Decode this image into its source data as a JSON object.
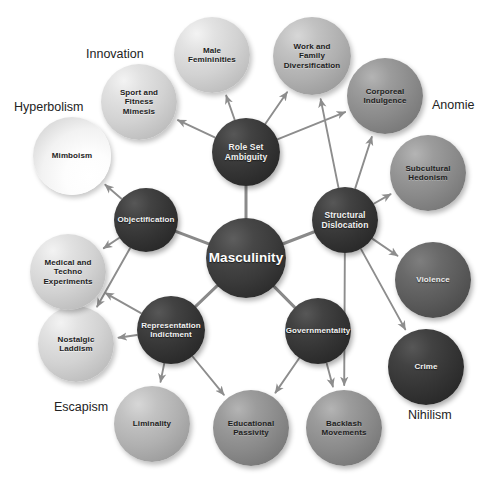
{
  "figure": {
    "kind": "concept-map",
    "background": "#ffffff",
    "hub_label": "Masculinity"
  },
  "captions": [
    {
      "id": "innovation",
      "label": "Innovation",
      "x": 86,
      "y": 47
    },
    {
      "id": "hyperbolism",
      "label": "Hyperbolism",
      "x": 14,
      "y": 100
    },
    {
      "id": "anomie",
      "label": "Anomie",
      "x": 432,
      "y": 98
    },
    {
      "id": "escapism",
      "label": "Escapism",
      "x": 54,
      "y": 400
    },
    {
      "id": "nihilism",
      "label": "Nihilism",
      "x": 408,
      "y": 408
    }
  ],
  "nodes": [
    {
      "id": "masculinity",
      "label": "Masculinity",
      "cx": 246,
      "cy": 258,
      "r": 40,
      "tone": "t-hub",
      "font": 13.5,
      "ring": "hub"
    },
    {
      "id": "role-set",
      "label": "Role Set<br>Ambiguity",
      "cx": 246,
      "cy": 152,
      "r": 34,
      "tone": "t-dark",
      "font": 8.5,
      "ring": "inner"
    },
    {
      "id": "structural",
      "label": "Structural<br>Dislocation",
      "cx": 345,
      "cy": 220,
      "r": 33,
      "tone": "t-dark",
      "font": 8.5,
      "ring": "inner"
    },
    {
      "id": "objectify",
      "label": "Objectification",
      "cx": 146,
      "cy": 220,
      "r": 32,
      "tone": "t-dark",
      "font": 8.0,
      "ring": "inner"
    },
    {
      "id": "representation",
      "label": "Representation<br>Indictment",
      "cx": 171,
      "cy": 330,
      "r": 34,
      "tone": "t-dark",
      "font": 8.0,
      "ring": "inner"
    },
    {
      "id": "governmentality",
      "label": "Governmentality",
      "cx": 318,
      "cy": 331,
      "r": 33,
      "tone": "t-dark",
      "font": 8.0,
      "ring": "inner"
    },
    {
      "id": "mimboism",
      "label": "Mimboism",
      "cx": 72,
      "cy": 156,
      "r": 39,
      "tone": "t-white",
      "font": 8.0,
      "ring": "outer"
    },
    {
      "id": "sport",
      "label": "Sport and<br>Fitness<br>Mimesis",
      "cx": 139,
      "cy": 102,
      "r": 38,
      "tone": "t-light",
      "font": 8.0,
      "ring": "outer"
    },
    {
      "id": "male-fem",
      "label": "Male<br>Femininities",
      "cx": 212,
      "cy": 55,
      "r": 38,
      "tone": "t-light",
      "font": 8.0,
      "ring": "outer"
    },
    {
      "id": "work-family",
      "label": "Work and<br>Family<br>Diversification",
      "cx": 312,
      "cy": 56,
      "r": 39,
      "tone": "t-midlight",
      "font": 8.0,
      "ring": "outer"
    },
    {
      "id": "corporeal",
      "label": "Corporeal<br>Indulgence",
      "cx": 385,
      "cy": 96,
      "r": 38,
      "tone": "t-mid",
      "font": 8.0,
      "ring": "outer"
    },
    {
      "id": "subcultural",
      "label": "Subcultural<br>Hedonism",
      "cx": 428,
      "cy": 173,
      "r": 38,
      "tone": "t-mid",
      "font": 8.0,
      "ring": "outer"
    },
    {
      "id": "violence",
      "label": "Violence",
      "cx": 433,
      "cy": 280,
      "r": 38,
      "tone": "t-darkgray",
      "font": 8.0,
      "ring": "outer"
    },
    {
      "id": "crime",
      "label": "Crime",
      "cx": 426,
      "cy": 367,
      "r": 38,
      "tone": "t-dark",
      "font": 8.0,
      "ring": "outer"
    },
    {
      "id": "backlash",
      "label": "Backlash<br>Movements",
      "cx": 344,
      "cy": 428,
      "r": 38,
      "tone": "t-mid",
      "font": 8.0,
      "ring": "outer"
    },
    {
      "id": "educational",
      "label": "Educational<br>Passivity",
      "cx": 251,
      "cy": 428,
      "r": 38,
      "tone": "t-mid",
      "font": 8.0,
      "ring": "outer"
    },
    {
      "id": "liminality",
      "label": "Liminality",
      "cx": 152,
      "cy": 424,
      "r": 38,
      "tone": "t-midlight",
      "font": 8.0,
      "ring": "outer"
    },
    {
      "id": "nostalgic",
      "label": "Nostalgic<br>Laddism",
      "cx": 76,
      "cy": 344,
      "r": 38,
      "tone": "t-light",
      "font": 8.0,
      "ring": "outer"
    },
    {
      "id": "medical",
      "label": "Medical and<br>Techno<br>Experiments",
      "cx": 68,
      "cy": 272,
      "r": 38,
      "tone": "t-light",
      "font": 8.0,
      "ring": "outer"
    }
  ],
  "links": [
    {
      "from": "masculinity",
      "to": "role-set",
      "arrow": false
    },
    {
      "from": "masculinity",
      "to": "structural",
      "arrow": false
    },
    {
      "from": "masculinity",
      "to": "objectify",
      "arrow": false
    },
    {
      "from": "masculinity",
      "to": "representation",
      "arrow": false
    },
    {
      "from": "masculinity",
      "to": "governmentality",
      "arrow": false
    },
    {
      "from": "role-set",
      "to": "sport",
      "arrow": true
    },
    {
      "from": "role-set",
      "to": "male-fem",
      "arrow": true
    },
    {
      "from": "role-set",
      "to": "work-family",
      "arrow": true
    },
    {
      "from": "role-set",
      "to": "corporeal",
      "arrow": true
    },
    {
      "from": "objectify",
      "to": "mimboism",
      "arrow": true
    },
    {
      "from": "objectify",
      "to": "medical",
      "arrow": true
    },
    {
      "from": "objectify",
      "to": "nostalgic",
      "arrow": true
    },
    {
      "from": "structural",
      "to": "work-family",
      "arrow": true
    },
    {
      "from": "structural",
      "to": "corporeal",
      "arrow": true
    },
    {
      "from": "structural",
      "to": "subcultural",
      "arrow": true
    },
    {
      "from": "structural",
      "to": "violence",
      "arrow": true
    },
    {
      "from": "structural",
      "to": "crime",
      "arrow": true
    },
    {
      "from": "structural",
      "to": "backlash",
      "arrow": true
    },
    {
      "from": "representation",
      "to": "medical",
      "arrow": true
    },
    {
      "from": "representation",
      "to": "nostalgic",
      "arrow": true
    },
    {
      "from": "representation",
      "to": "liminality",
      "arrow": true
    },
    {
      "from": "representation",
      "to": "educational",
      "arrow": true
    },
    {
      "from": "governmentality",
      "to": "educational",
      "arrow": true
    },
    {
      "from": "governmentality",
      "to": "backlash",
      "arrow": true
    }
  ],
  "style": {
    "edge_color": "#8d8d8d",
    "hub_edge_color": "#8a8a8a",
    "edge_width": 1.9,
    "hub_edge_width": 3.0
  }
}
